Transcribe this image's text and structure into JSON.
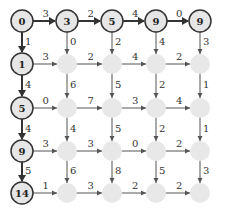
{
  "diagram": {
    "title": "",
    "cols": [
      22,
      67,
      112,
      156,
      200
    ],
    "rows": [
      21,
      64,
      108,
      151,
      193
    ],
    "radius": 11,
    "colors": {
      "active_fill": "#e6e6e6",
      "active_stroke": "#333333",
      "inactive_fill": "#e8e8e8",
      "bold_edge": "#333333",
      "thin_edge": "#555555"
    },
    "node_values": [
      [
        "0",
        "3",
        "5",
        "9",
        "9"
      ],
      [
        "1",
        "",
        "",
        "",
        ""
      ],
      [
        "5",
        "",
        "",
        "",
        ""
      ],
      [
        "9",
        "",
        "",
        "",
        ""
      ],
      [
        "14",
        "",
        "",
        "",
        ""
      ]
    ],
    "horizontal_weights": [
      [
        "3",
        "2",
        "4",
        "0"
      ],
      [
        "3",
        "2",
        "4",
        "2"
      ],
      [
        "0",
        "7",
        "3",
        "4"
      ],
      [
        "3",
        "3",
        "0",
        "2"
      ],
      [
        "1",
        "3",
        "2",
        "2"
      ]
    ],
    "vertical_weights": [
      [
        "1",
        "0",
        "2",
        "4",
        "3"
      ],
      [
        "4",
        "6",
        "5",
        "2",
        "1"
      ],
      [
        "4",
        "4",
        "5",
        "2",
        "1"
      ],
      [
        "5",
        "6",
        "8",
        "5",
        "3"
      ]
    ]
  }
}
